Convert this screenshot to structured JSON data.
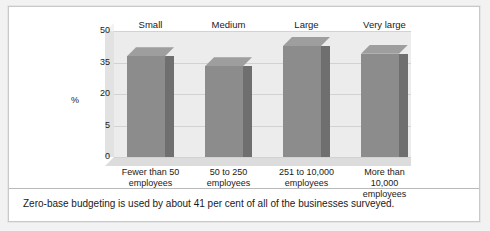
{
  "figure": {
    "caption": "Zero-base budgeting is used by about 41 per cent of all of the businesses surveyed.",
    "axis_unit_label": "%"
  },
  "chart_data": {
    "type": "bar",
    "title": "",
    "xlabel": "",
    "ylabel": "%",
    "ylim": [
      0,
      50
    ],
    "grid": true,
    "legend": "none",
    "style": "3d-column",
    "yticks": [
      50,
      35,
      20,
      5,
      0
    ],
    "group_labels": [
      "Small",
      "Medium",
      "Large",
      "Very large"
    ],
    "categories": [
      "Fewer than 50 employees",
      "50 to 250 employees",
      "251 to 10,000 employees",
      "More than 10,000 employees"
    ],
    "category_lines": [
      [
        "Fewer than 50",
        "employees"
      ],
      [
        "50 to 250",
        "employees"
      ],
      [
        "251 to 10,000",
        "employees"
      ],
      [
        "More than",
        "10,000",
        "employees"
      ]
    ],
    "values": [
      40,
      36,
      44,
      41
    ],
    "colors": {
      "bar_front": "#8c8c8c",
      "bar_side": "#6f6f6f",
      "bar_top": "#9e9e9e",
      "wall": "#ececec",
      "floor": "#dcdcdc",
      "gridline": "#d2d2d2"
    }
  }
}
